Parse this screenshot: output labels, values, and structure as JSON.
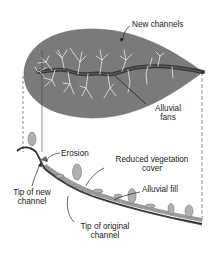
{
  "diagram": {
    "type": "landscape-cross-section",
    "colors": {
      "basin_fill": "#7a7a7a",
      "main_channel": "#3a3a3a",
      "tributaries": "#e8e8e8",
      "slope_line": "#2a2a2a",
      "vegetation": "#a8a8a8",
      "alluvial_fill": "#8f8f8f",
      "guide_lines": "#444444",
      "text": "#222222"
    },
    "labels": {
      "new_channels": "New channels",
      "alluvial_fans_line1": "Alluvial",
      "alluvial_fans_line2": "fans",
      "erosion": "Erosion",
      "reduced_vegetation_line1": "Reduced vegetation",
      "reduced_vegetation_line2": "cover",
      "alluvial_fill": "Alluvial fill",
      "tip_new_channel_line1": "Tip of new",
      "tip_new_channel_line2": "channel",
      "tip_original_channel_line1": "Tip of original",
      "tip_original_channel_line2": "channel"
    }
  }
}
